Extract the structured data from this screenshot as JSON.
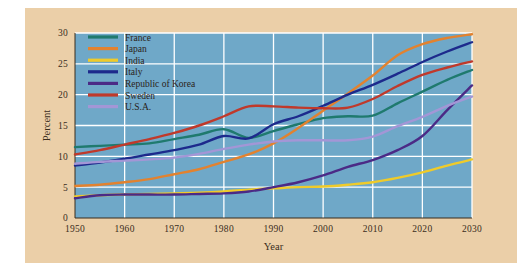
{
  "figure": {
    "background_color": "#ffffff",
    "panel_color": "#ebcfa8",
    "plot_background_color": "#6fa8c8",
    "gridline_color": "#ffffff"
  },
  "axes": {
    "x_title": "Year",
    "y_title": "Percent",
    "x_ticks": [
      "1950",
      "1960",
      "1970",
      "1980",
      "1990",
      "2000",
      "2010",
      "2020",
      "2030"
    ],
    "y_ticks": [
      "0",
      "5",
      "10",
      "15",
      "20",
      "25",
      "30"
    ]
  },
  "legend": {
    "items": [
      {
        "label": "France",
        "color": "#1f7a6e"
      },
      {
        "label": "Japan",
        "color": "#e2822f"
      },
      {
        "label": "India",
        "color": "#efcb2a"
      },
      {
        "label": "Italy",
        "color": "#1d2a8c"
      },
      {
        "label": "Republic of Korea",
        "color": "#4b2a86"
      },
      {
        "label": "Sweden",
        "color": "#c0392b"
      },
      {
        "label": "U.S.A.",
        "color": "#a396d6"
      }
    ]
  },
  "chart_data": {
    "type": "line",
    "title": "",
    "subtitle": "",
    "xlabel": "Year",
    "ylabel": "Percent",
    "xlim": [
      1950,
      2030
    ],
    "ylim": [
      0,
      30
    ],
    "xticks": [
      1950,
      1960,
      1970,
      1980,
      1990,
      2000,
      2010,
      2020,
      2030
    ],
    "yticks": [
      0,
      5,
      10,
      15,
      20,
      25,
      30
    ],
    "grid": true,
    "legend_position": "top-left",
    "x": [
      1950,
      1955,
      1960,
      1965,
      1970,
      1975,
      1980,
      1985,
      1990,
      1995,
      2000,
      2005,
      2010,
      2015,
      2020,
      2025,
      2030
    ],
    "series": [
      {
        "name": "France",
        "color": "#1f7a6e",
        "values": [
          11.5,
          11.7,
          11.9,
          12.1,
          12.8,
          13.5,
          14.4,
          13.0,
          14.1,
          15.2,
          16.2,
          16.5,
          16.6,
          18.6,
          20.5,
          22.4,
          24.0
        ]
      },
      {
        "name": "Japan",
        "color": "#e2822f",
        "values": [
          5.2,
          5.4,
          5.8,
          6.3,
          7.1,
          7.9,
          9.1,
          10.3,
          12.1,
          14.6,
          17.4,
          20.2,
          23.1,
          26.4,
          28.2,
          29.2,
          29.8
        ]
      },
      {
        "name": "India",
        "color": "#efcb2a",
        "values": [
          3.5,
          3.7,
          3.8,
          3.9,
          4.0,
          4.1,
          4.3,
          4.6,
          4.8,
          5.0,
          5.1,
          5.4,
          5.8,
          6.5,
          7.4,
          8.5,
          9.5
        ]
      },
      {
        "name": "Italy",
        "color": "#1d2a8c",
        "values": [
          8.5,
          9.0,
          9.6,
          10.3,
          11.0,
          11.9,
          13.3,
          12.9,
          15.2,
          16.5,
          18.2,
          20.0,
          21.6,
          23.4,
          25.3,
          27.0,
          28.5
        ]
      },
      {
        "name": "Republic of Korea",
        "color": "#4b2a86",
        "values": [
          3.2,
          3.7,
          3.8,
          3.8,
          3.8,
          3.9,
          4.0,
          4.3,
          5.0,
          5.8,
          6.9,
          8.3,
          9.4,
          11.0,
          13.3,
          17.5,
          21.5
        ]
      },
      {
        "name": "Sweden",
        "color": "#c0392b",
        "values": [
          10.3,
          11.0,
          11.9,
          12.8,
          13.8,
          15.0,
          16.5,
          18.1,
          18.1,
          17.9,
          17.8,
          17.9,
          19.3,
          21.4,
          23.2,
          24.4,
          25.4
        ]
      },
      {
        "name": "U.S.A.",
        "color": "#a396d6",
        "values": [
          8.8,
          9.1,
          9.3,
          9.5,
          9.8,
          10.4,
          11.2,
          11.9,
          12.4,
          12.6,
          12.6,
          12.6,
          13.2,
          14.9,
          16.4,
          18.2,
          19.7
        ]
      }
    ]
  }
}
